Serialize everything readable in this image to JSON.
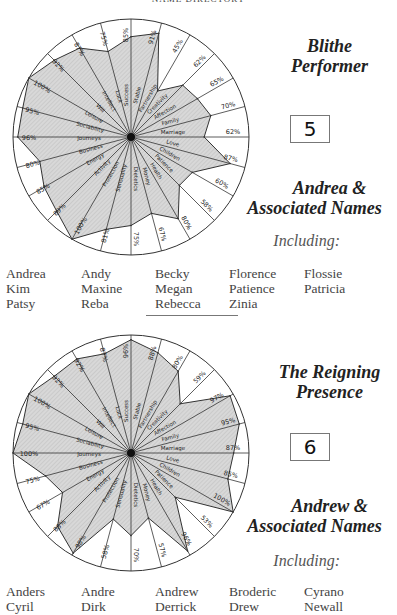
{
  "header": "NAME DIRECTORY",
  "sections": [
    {
      "title_line1": "Blithe",
      "title_line2": "Performer",
      "number": "5",
      "names_line1": "Andrea &",
      "names_line2": "Associated Names",
      "including": "Including:",
      "names": [
        "Andrea",
        "Andy",
        "Becky",
        "Florence",
        "Flossie",
        "Kim",
        "Maxine",
        "Megan",
        "Patience",
        "Patricia",
        "Patsy",
        "Reba",
        "Rebecca",
        "Zinia",
        ""
      ]
    },
    {
      "title_line1": "The Reigning",
      "title_line2": "Presence",
      "number": "6",
      "names_line1": "Andrew &",
      "names_line2": "Associated Names",
      "including": "Including:",
      "names": [
        "Anders",
        "Andre",
        "Andrew",
        "Broderic",
        "Cyrano",
        "Cyril",
        "Dirk",
        "Derrick",
        "Drew",
        "Newall"
      ]
    }
  ],
  "chart_data": [
    {
      "type": "radial-bar",
      "title": "Blithe Performer",
      "categories": [
        "Success",
        "Stable",
        "Partnership",
        "Creativity",
        "Affection",
        "Family",
        "Marriage",
        "Love",
        "Children",
        "Patience",
        "Health",
        "Money",
        "Dietetics",
        "Sensuality",
        "Protection",
        "Activity",
        "Energy",
        "Business",
        "Journeys",
        "Sociability",
        "Leisure",
        "Will",
        "Intellect",
        "Luck"
      ],
      "values": [
        85,
        91,
        45,
        62,
        65,
        70,
        62,
        87,
        60,
        58,
        80,
        67,
        75,
        81,
        100,
        89,
        85,
        80,
        96,
        95,
        100,
        92,
        87,
        75
      ],
      "value_labels": [
        "85%",
        "91%",
        "45%",
        "62%",
        "65%",
        "70%",
        "62%",
        "87%",
        "60%",
        "58%",
        "80%",
        "67%",
        "75%",
        "81%",
        "100%",
        "89%",
        "85%",
        "80%",
        "96%",
        "95%",
        "100%",
        "92%",
        "87%",
        "75%"
      ],
      "range": [
        0,
        100
      ]
    },
    {
      "type": "radial-bar",
      "title": "The Reigning Presence",
      "categories": [
        "Success",
        "Stable",
        "Partnership",
        "Creativity",
        "Affection",
        "Family",
        "Marriage",
        "Love",
        "Children",
        "Patience",
        "Health",
        "Money",
        "Dietetics",
        "Sensuality",
        "Protection",
        "Activity",
        "Energy",
        "Business",
        "Journeys",
        "Sociability",
        "Leisure",
        "Will",
        "Intellect",
        "Luck"
      ],
      "values": [
        96,
        88,
        80,
        59,
        97,
        95,
        87,
        85,
        100,
        53,
        96,
        57,
        70,
        58,
        98,
        88,
        67,
        75,
        100,
        95,
        100,
        92,
        92,
        87
      ],
      "value_labels": [
        "96%",
        "88%",
        "80%",
        "59%",
        "97%",
        "95%",
        "87%",
        "85%",
        "100%",
        "53%",
        "96%",
        "57%",
        "70%",
        "58%",
        "98%",
        "88%",
        "67%",
        "75%",
        "100%",
        "95%",
        "100%",
        "92%",
        "92%",
        "87%"
      ],
      "range": [
        0,
        100
      ]
    }
  ]
}
